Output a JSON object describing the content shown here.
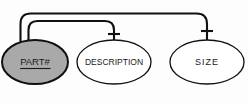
{
  "diagram": {
    "kind": "er-attribute-diagram",
    "background_color": "#fdfdfd",
    "line_color": "#111111",
    "text_color": "#1a1a1a",
    "nodes": [
      {
        "id": "part-number",
        "label": "PART#",
        "shape": "ellipse",
        "is_key": true,
        "underlined": true,
        "fill_color": "#a9a9a9",
        "stroke_color": "#111111",
        "cx": 35,
        "cy": 62,
        "rx": 33,
        "ry": 22,
        "font_size": 9.5
      },
      {
        "id": "description",
        "label": "DESCRIPTION",
        "shape": "ellipse",
        "is_key": false,
        "underlined": false,
        "fill_color": "#ffffff",
        "stroke_color": "#111111",
        "cx": 114,
        "cy": 62,
        "rx": 37,
        "ry": 22,
        "font_size": 8.5
      },
      {
        "id": "size",
        "label": "SIZE",
        "shape": "ellipse",
        "is_key": false,
        "underlined": false,
        "fill_color": "#ffffff",
        "stroke_color": "#111111",
        "cx": 207,
        "cy": 62,
        "rx": 37,
        "ry": 22,
        "font_size": 9,
        "font_spacing": 1
      }
    ],
    "connectors": [
      {
        "id": "part-to-description",
        "from": "part-number",
        "to": "description",
        "style": "rounded-elbow",
        "end_marker": "crossbar",
        "path": "M 28.5 41.5 L 28.5 30 Q 28.5 21 37.5 21 L 105 21 Q 114 21 114 30 L 114 40.5",
        "marker_y": 34,
        "marker_half_width": 6
      },
      {
        "id": "part-to-size",
        "from": "part-number",
        "to": "size",
        "style": "rounded-elbow",
        "end_marker": "crossbar",
        "path": "M 20.5 43 L 20.5 24 Q 20.5 13.5 31 13.5 L 196.5 13.5 Q 207 13.5 207 24 L 207 40.5",
        "marker_y": 31,
        "marker_half_width": 6
      }
    ]
  }
}
